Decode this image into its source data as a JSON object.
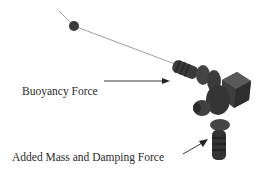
{
  "diagram": {
    "labels": {
      "buoyancy": "Buoyancy Force",
      "added_mass": "Added Mass and Damping Force"
    },
    "colors": {
      "text": "#2a2a2a",
      "tether": "#777777",
      "body": "#3c3c3c",
      "arrow": "#222222"
    }
  }
}
